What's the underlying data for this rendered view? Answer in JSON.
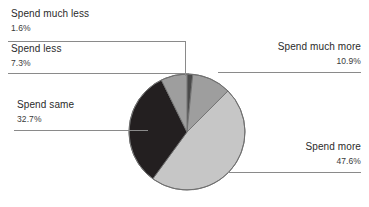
{
  "chart_data": {
    "type": "pie",
    "title": "",
    "subtitle": "",
    "xlabel": "",
    "ylabel": "",
    "legend_position": "callout-labels",
    "grid": false,
    "categories": [
      "Spend much less",
      "Spend less",
      "Spend same",
      "Spend more",
      "Spend much more"
    ],
    "values": [
      1.6,
      7.3,
      32.7,
      47.6,
      10.9
    ],
    "value_unit": "%",
    "slices": [
      {
        "label": "Spend much less",
        "value": 1.6,
        "value_label": "1.6%",
        "color": "#4a4a4a",
        "label_position": "top-left"
      },
      {
        "label": "Spend less",
        "value": 7.3,
        "value_label": "7.3%",
        "color": "#9e9e9e",
        "label_position": "upper-left"
      },
      {
        "label": "Spend same",
        "value": 32.7,
        "value_label": "32.7%",
        "color": "#231f20",
        "label_position": "left"
      },
      {
        "label": "Spend more",
        "value": 47.6,
        "value_label": "47.6%",
        "color": "#c6c6c6",
        "label_position": "bottom-right"
      },
      {
        "label": "Spend much more",
        "value": 10.9,
        "value_label": "10.9%",
        "color": "#9e9e9e",
        "label_position": "upper-right"
      }
    ],
    "colors": {
      "background": "#ffffff",
      "outline": "#6f6f6f",
      "leader_line": "#8a8a8a",
      "text": "#2b2b2b"
    },
    "geometry": {
      "center_x": 187,
      "center_y": 132,
      "radius": 58,
      "start_angle_deg": 0,
      "direction": "clockwise"
    }
  }
}
